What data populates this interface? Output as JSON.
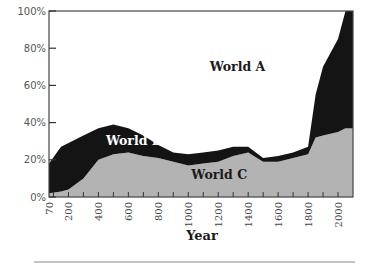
{
  "chart_data": {
    "type": "area",
    "stacked": true,
    "normalized_percent": true,
    "title": "",
    "xlabel": "Year",
    "ylabel": "",
    "xlim": [
      70,
      2100
    ],
    "ylim": [
      0,
      100
    ],
    "grid": false,
    "legend": "inline labels",
    "x_tick_labels": [
      "70",
      "200",
      "400",
      "600",
      "800",
      "1000",
      "1200",
      "1400",
      "1600",
      "1800",
      "2000"
    ],
    "x_minor_ticks_every": 100,
    "y_tick_labels": [
      "0%",
      "20%",
      "40%",
      "60%",
      "80%",
      "100%"
    ],
    "x": [
      70,
      150,
      200,
      300,
      400,
      500,
      600,
      700,
      800,
      900,
      1000,
      1100,
      1200,
      1300,
      1400,
      1500,
      1600,
      1700,
      1800,
      1850,
      1900,
      2000,
      2050
    ],
    "series": [
      {
        "name": "World C",
        "color": "#b3b3b3",
        "label_position": [
          0.56,
          0.12
        ],
        "values": [
          2,
          3,
          4,
          10,
          20,
          23,
          24,
          22,
          21,
          19,
          17,
          18,
          19,
          22,
          24,
          19,
          19,
          21,
          23,
          32,
          33,
          35,
          37
        ]
      },
      {
        "name": "World B",
        "color": "#141414",
        "label_position": [
          0.28,
          0.3
        ],
        "values": [
          16,
          24,
          25,
          23,
          17,
          16,
          13,
          11,
          7,
          5,
          6,
          6,
          6,
          5,
          3,
          2,
          3,
          3,
          4,
          23,
          37,
          50,
          63
        ]
      },
      {
        "name": "World A",
        "color": "#ffffff",
        "label_position": [
          0.62,
          0.7
        ],
        "values": [
          82,
          73,
          71,
          67,
          63,
          61,
          63,
          67,
          72,
          76,
          77,
          76,
          75,
          73,
          73,
          79,
          78,
          76,
          73,
          45,
          30,
          15,
          0
        ]
      }
    ]
  }
}
